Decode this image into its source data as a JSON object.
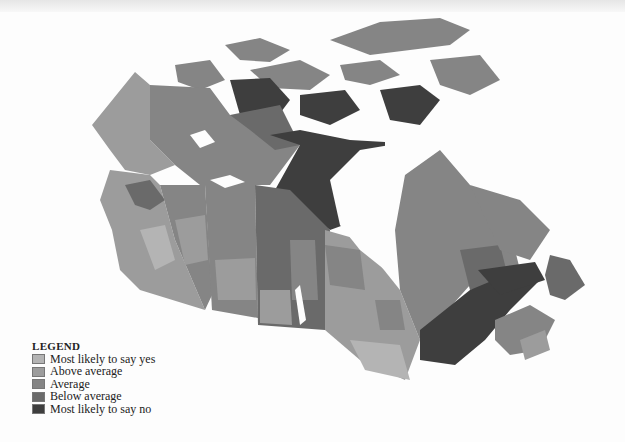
{
  "map": {
    "title": "Canada choropleth map",
    "region_shades": {
      "most_likely_yes": "#b4b4b4",
      "above_average": "#9c9c9c",
      "average": "#858585",
      "below_average": "#6a6a6a",
      "most_likely_no": "#3e3e3e"
    }
  },
  "legend": {
    "title": "LEGEND",
    "items": [
      {
        "label": "Most likely to say yes",
        "color": "#b4b4b4"
      },
      {
        "label": "Above average",
        "color": "#9c9c9c"
      },
      {
        "label": "Average",
        "color": "#858585"
      },
      {
        "label": "Below average",
        "color": "#6a6a6a"
      },
      {
        "label": "Most likely to say no",
        "color": "#3e3e3e"
      }
    ]
  }
}
